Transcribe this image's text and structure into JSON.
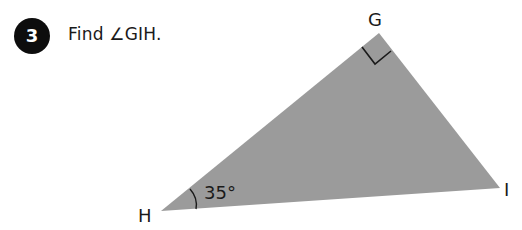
{
  "question": {
    "number": "3",
    "prompt": "Find ∠GIH."
  },
  "figure": {
    "shape": "right-triangle",
    "fill_color": "#9b9b9b",
    "vertices": [
      {
        "name": "G",
        "label": "G",
        "note": "right angle"
      },
      {
        "name": "H",
        "label": "H"
      },
      {
        "name": "I",
        "label": "I"
      }
    ],
    "angle_H": {
      "label": "35°"
    }
  }
}
